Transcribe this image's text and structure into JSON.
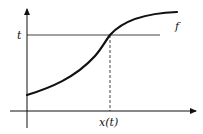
{
  "diagram": {
    "labels": {
      "t": "t",
      "f": "f",
      "x_of_t": "x(t)"
    },
    "colors": {
      "stroke": "#111111",
      "background": "#ffffff"
    },
    "elements": {
      "y_axis": "vertical axis with arrow",
      "x_axis": "horizontal axis with arrow",
      "t_line": "horizontal level line at t",
      "dashed_drop": "dashed vertical line from intersection to x-axis",
      "curve": "increasing curve f"
    }
  }
}
